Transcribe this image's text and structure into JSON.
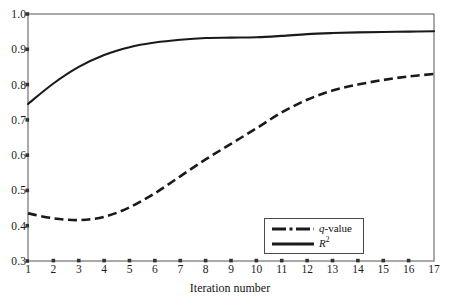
{
  "chart_data": {
    "type": "line",
    "title": "",
    "xlabel": "Iteration number",
    "ylabel": "",
    "xlim": [
      1,
      17
    ],
    "ylim": [
      0.3,
      1.0
    ],
    "grid": false,
    "legend_position": "bottom-right",
    "x": [
      1,
      2,
      3,
      4,
      5,
      6,
      7,
      8,
      9,
      10,
      11,
      12,
      13,
      14,
      15,
      16,
      17
    ],
    "xtick_labels": [
      "1",
      "2",
      "3",
      "4",
      "5",
      "6",
      "7",
      "8",
      "9",
      "10",
      "11",
      "12",
      "13",
      "14",
      "15",
      "16",
      "17"
    ],
    "ytick_labels": [
      "0.3",
      "0.4",
      "0.5",
      "0.6",
      "0.7",
      "0.8",
      "0.9",
      "1.0"
    ],
    "ytick_values": [
      0.3,
      0.4,
      0.5,
      0.6,
      0.7,
      0.8,
      0.9,
      1.0
    ],
    "series": [
      {
        "name": "q-value",
        "label_plain": "q-value",
        "style": "dash-dot",
        "color": "#1a1a1a",
        "values": [
          0.435,
          0.421,
          0.416,
          0.425,
          0.452,
          0.492,
          0.54,
          0.588,
          0.632,
          0.676,
          0.721,
          0.757,
          0.783,
          0.8,
          0.813,
          0.823,
          0.83
        ]
      },
      {
        "name": "R2",
        "label_plain": "R2",
        "style": "solid",
        "color": "#1a1a1a",
        "values": [
          0.745,
          0.803,
          0.85,
          0.884,
          0.906,
          0.919,
          0.927,
          0.932,
          0.933,
          0.934,
          0.938,
          0.943,
          0.946,
          0.948,
          0.949,
          0.95,
          0.951
        ]
      }
    ]
  },
  "axes": {
    "x_title": "Iteration number",
    "frame_color": "#555555"
  },
  "legend": {
    "entries": [
      {
        "label": "q-value",
        "style": "dash-dot"
      },
      {
        "label": "R2",
        "style": "solid"
      }
    ]
  }
}
